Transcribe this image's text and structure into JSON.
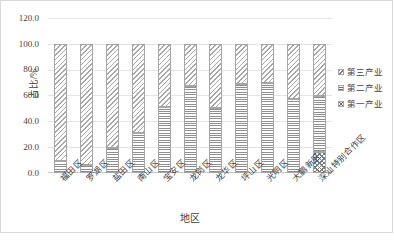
{
  "chart_data": {
    "type": "bar",
    "subtype": "stacked-bar-100-percent",
    "title": "",
    "xlabel": "地区",
    "ylabel": "占比/%",
    "ylim": [
      0,
      120
    ],
    "yticks": [
      "0.0",
      "20.0",
      "40.0",
      "60.0",
      "80.0",
      "100.0",
      "120.0"
    ],
    "ytick_values": [
      0,
      20,
      40,
      60,
      80,
      100,
      120
    ],
    "grid": true,
    "legend_position": "right",
    "categories": [
      "福田区",
      "罗湖区",
      "盐田区",
      "南山区",
      "宝安区",
      "龙岗区",
      "龙华区",
      "坪山区",
      "光明区",
      "大鹏新区",
      "深汕特别合作区"
    ],
    "series": [
      {
        "name": "第一产业",
        "pattern": "checkerboard",
        "values": [
          0.0,
          0.0,
          0.0,
          0.0,
          0.0,
          0.0,
          0.0,
          0.0,
          0.0,
          0.0,
          16.0
        ]
      },
      {
        "name": "第二产业",
        "pattern": "horizontal-lines",
        "values": [
          9.0,
          6.0,
          19.0,
          31.0,
          51.0,
          67.0,
          50.0,
          69.0,
          70.0,
          57.0,
          44.0
        ]
      },
      {
        "name": "第三产业",
        "pattern": "diagonal-hatch",
        "values": [
          91.0,
          94.0,
          81.0,
          69.0,
          49.0,
          33.0,
          50.0,
          31.0,
          30.0,
          43.0,
          40.0
        ]
      }
    ],
    "colors": {
      "series_outline": "#a6a6a6",
      "gridline": "#e4e4e4",
      "axis_text": "#3f3f3f",
      "background": "#ffffff"
    }
  },
  "legend": {
    "items": [
      {
        "label": "第三产业",
        "pattern": "tertiary"
      },
      {
        "label": "第二产业",
        "pattern": "secondary"
      },
      {
        "label": "第一产业",
        "pattern": "primary"
      }
    ]
  },
  "caption": ""
}
